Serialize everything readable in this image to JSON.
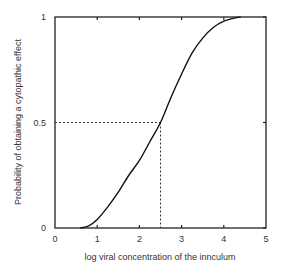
{
  "chart_data": {
    "type": "line",
    "title": "",
    "xlabel": "log viral concentration of the innculum",
    "ylabel": "Probability of obtaining a cytopathic effect",
    "xlim": [
      0,
      5
    ],
    "ylim": [
      0,
      1
    ],
    "x_ticks": [
      "0",
      "1",
      "2",
      "3",
      "4",
      "5"
    ],
    "y_ticks": [
      "0",
      "0.5",
      "1"
    ],
    "grid": false,
    "legend": null,
    "series": [
      {
        "name": "sigmoid dose-response",
        "x": [
          0.6,
          0.8,
          1.0,
          1.25,
          1.5,
          1.75,
          2.0,
          2.25,
          2.5,
          2.75,
          3.0,
          3.25,
          3.5,
          3.75,
          4.0,
          4.25,
          4.4
        ],
        "y": [
          0.0,
          0.01,
          0.04,
          0.1,
          0.17,
          0.25,
          0.32,
          0.41,
          0.5,
          0.62,
          0.73,
          0.83,
          0.9,
          0.95,
          0.98,
          0.995,
          1.0
        ]
      }
    ],
    "annotations": [
      {
        "type": "dashed-guide",
        "from": [
          0,
          0.5
        ],
        "to": [
          2.5,
          0.5
        ]
      },
      {
        "type": "dashed-guide",
        "from": [
          2.5,
          0.5
        ],
        "to": [
          2.5,
          0
        ]
      }
    ]
  }
}
